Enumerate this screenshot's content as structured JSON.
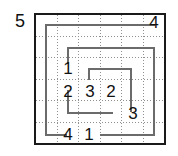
{
  "puzzle": {
    "kind": "spiral-grid-puzzle",
    "grid": {
      "columns": 6,
      "rows": 6,
      "border_color": "#1a1a1a",
      "gridline_color": "#8f8f8f",
      "gridline_style": "dotted",
      "background": "#ffffff"
    },
    "path": {
      "stroke_color": "#6b6b6b",
      "description": "nested rectangular spiral"
    },
    "clues": {
      "outside": [
        {
          "name": "clue-outside-left",
          "value": "5"
        }
      ],
      "inside": [
        {
          "name": "clue-top-right",
          "value": "4"
        },
        {
          "name": "clue-mid-left-upper",
          "value": "1"
        },
        {
          "name": "clue-center-left",
          "value": "2"
        },
        {
          "name": "clue-center",
          "value": "3"
        },
        {
          "name": "clue-center-right",
          "value": "2"
        },
        {
          "name": "clue-right-lower",
          "value": "3"
        },
        {
          "name": "clue-bottom-left",
          "value": "4"
        },
        {
          "name": "clue-bottom-second",
          "value": "1"
        }
      ]
    }
  }
}
